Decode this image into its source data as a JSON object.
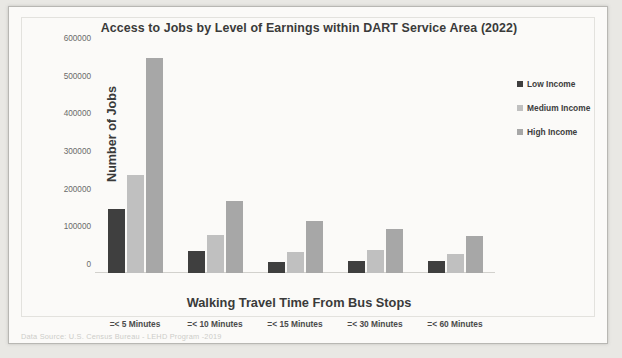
{
  "chart_data": {
    "type": "bar",
    "title": "Access to Jobs by Level of Earnings within DART Service Area (2022)",
    "xlabel": "Walking Travel Time From Bus Stops",
    "ylabel": "Number of Jobs",
    "categories": [
      "=< 5 Minutes",
      "=< 10 Minutes",
      "=< 15 Minutes",
      "=< 30 Minutes",
      "=< 60 Minutes"
    ],
    "series": [
      {
        "name": "Low Income",
        "color": "#3f3f3f",
        "values": [
          170000,
          58000,
          30000,
          33000,
          33000
        ]
      },
      {
        "name": "Medium Income",
        "color": "#c0c0c0",
        "values": [
          260000,
          100000,
          55000,
          60000,
          50000
        ]
      },
      {
        "name": "High Income",
        "color": "#a7a7a7",
        "values": [
          570000,
          190000,
          137000,
          117000,
          97000
        ]
      }
    ],
    "ylim": [
      0,
      600000
    ],
    "yticks": [
      0,
      100000,
      200000,
      300000,
      400000,
      500000,
      600000
    ],
    "ytick_labels": [
      "0",
      "100000",
      "200000",
      "300000",
      "400000",
      "500000",
      "600000"
    ],
    "grid": false,
    "legend_position": "right"
  },
  "footer": {
    "source": "Data Source: U.S. Census Bureau - LEHD Program -2019"
  }
}
